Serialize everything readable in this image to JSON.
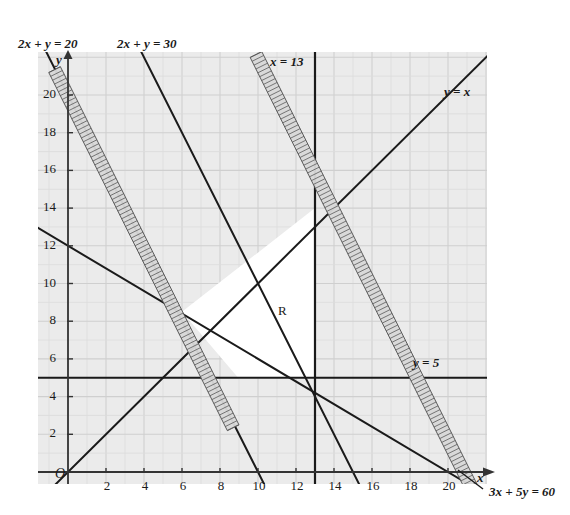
{
  "chart_data": {
    "type": "line",
    "title": "",
    "xlabel": "x",
    "ylabel": "y",
    "xlim": [
      -1.6,
      22
    ],
    "ylim": [
      -1.5,
      22.3
    ],
    "grid": true,
    "grid_minor_step": 1,
    "grid_major_step": 2,
    "origin_label": "O",
    "region_label": "R",
    "xticks": [
      2,
      4,
      6,
      8,
      10,
      12,
      14,
      16,
      18,
      20
    ],
    "yticks": [
      2,
      4,
      6,
      8,
      10,
      12,
      14,
      16,
      18,
      20
    ],
    "xtick_labels": [
      "2",
      "4",
      "6",
      "8",
      "10",
      "12",
      "14",
      "16",
      "18",
      "20"
    ],
    "ytick_labels": [
      "2",
      "4",
      "6",
      "8",
      "10",
      "12",
      "14",
      "16",
      "18",
      "20"
    ],
    "series": [
      {
        "name": "2x + y = 20",
        "label": "2x + y = 20",
        "equation": "2x + y = 20",
        "kind": "line",
        "a": 2,
        "b": 1,
        "c": 20,
        "x_intercept": 10,
        "y_intercept": 20,
        "label_pos": "top-left"
      },
      {
        "name": "2x + y = 30",
        "label": "2x + y = 30",
        "equation": "2x + y = 30",
        "kind": "line",
        "a": 2,
        "b": 1,
        "c": 30,
        "x_intercept": 15,
        "y_intercept": 30,
        "label_pos": "top-left-2"
      },
      {
        "name": "x = 13",
        "label": "x = 13",
        "equation": "x = 13",
        "kind": "vertical",
        "value": 13,
        "label_pos": "top"
      },
      {
        "name": "y = x",
        "label": "y = x",
        "equation": "y = x",
        "kind": "line",
        "slope": 1,
        "intercept": 0,
        "label_pos": "top-right"
      },
      {
        "name": "y = 5",
        "label": "y = 5",
        "equation": "y = 5",
        "kind": "horizontal",
        "value": 5,
        "label_pos": "right"
      },
      {
        "name": "3x + 5y = 60",
        "label": "3x + 5y = 60",
        "equation": "3x + 5y = 60",
        "kind": "line",
        "a": 3,
        "b": 5,
        "c": 60,
        "x_intercept": 20,
        "y_intercept": 12,
        "label_pos": "bottom-right"
      }
    ],
    "hatched_bands": [
      {
        "name": "shading-band-2x-plus-y-20",
        "along_line": "2x + y = 20",
        "side": "below-left",
        "from": [
          -0.4,
          21.5
        ],
        "to": [
          9.0,
          2.5
        ]
      },
      {
        "name": "shading-band-3x-plus-5y-60",
        "along_line": "3x + 5y = 60",
        "side": "below-right",
        "from": [
          10.2,
          22.3
        ],
        "to": [
          21.8,
          -1.2
        ]
      }
    ],
    "region": {
      "name": "R",
      "label": "R",
      "label_point": [
        12.2,
        8.6
      ],
      "description": "feasible region",
      "vertices": [
        [
          6.0,
          8.5
        ],
        [
          9.0,
          4.95
        ],
        [
          13.0,
          4.95
        ],
        [
          13.0,
          14.0
        ]
      ]
    }
  },
  "labels": {
    "line_2x_y_20": "2x + y = 20",
    "line_2x_y_30": "2x + y = 30",
    "line_x_13": "x = 13",
    "line_y_x": "y = x",
    "line_y_5": "y = 5",
    "line_3x_5y_60": "3x + 5y = 60",
    "region": "R",
    "origin": "O",
    "axis_x": "x",
    "axis_y": "y"
  },
  "colors": {
    "plot_background": "#ebebeb",
    "page_background": "#ffffff",
    "grid_minor": "#dcdcdc",
    "grid_major": "#cfcfcf",
    "line": "#1a1a1a",
    "axis": "#333333",
    "region_fill": "#ffffff",
    "band_fill": "#d9d9d9",
    "band_edge": "#555555",
    "text": "#1a1a1a"
  }
}
